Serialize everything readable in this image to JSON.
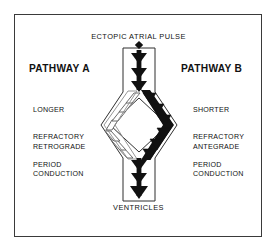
{
  "diagram": {
    "title_top": "ECTOPIC ATRIAL PULSE",
    "label_bottom": "VENTRICLES",
    "pathway_a": {
      "title": "PATHWAY A",
      "refractory_line1": "LONGER",
      "refractory_line2": "REFRACTORY",
      "refractory_line3": "PERIOD",
      "conduction_line1": "RETROGRADE",
      "conduction_line2": "CONDUCTION"
    },
    "pathway_b": {
      "title": "PATHWAY B",
      "refractory_line1": "SHORTER",
      "refractory_line2": "REFRACTORY",
      "refractory_line3": "PERIOD",
      "conduction_line1": "ANTEGRADE",
      "conduction_line2": "CONDUCTION"
    },
    "colors": {
      "ink": "#111111",
      "frame": "#3a3a3a",
      "background": "#ffffff",
      "antegrade_arrow": "#111111",
      "retrograde_arrow": "#ffffff",
      "retrograde_outline": "#555555"
    },
    "icons": {
      "origin_marker": "ectopic-origin-diamond",
      "antegrade": "solid-down-chevron",
      "retrograde": "hollow-up-chevron"
    }
  }
}
